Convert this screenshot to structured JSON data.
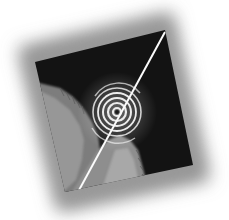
{
  "image": {
    "description": "Abstract artwork: rotated square with blurred gray vignette border, black field, diagonal white streak, concentric ripple rings and gray textured regions at lower left",
    "colors": {
      "background": "#ffffff",
      "border_gray": "#9a9a9a",
      "field": "#121212",
      "highlight": "#f2f2f2",
      "texture_gray": "#8a8a8a"
    }
  }
}
